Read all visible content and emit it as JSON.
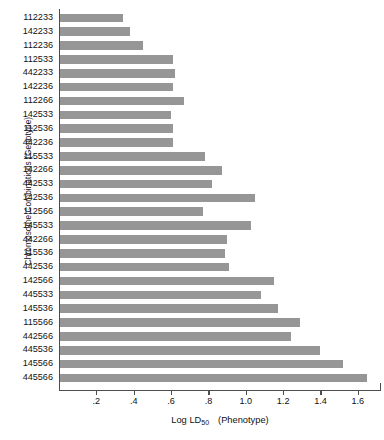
{
  "chart_data": {
    "type": "bar",
    "orientation": "horizontal",
    "title": "",
    "xlabel": "Log LD50  (Phenotype)",
    "ylabel": "Chromosome Combinations (Genotype)",
    "xlim": [
      0,
      1.74
    ],
    "xticks": [
      0.2,
      0.4,
      0.6,
      0.8,
      1.0,
      1.2,
      1.4,
      1.6
    ],
    "xtick_labels": [
      ".2",
      ".4",
      ".6",
      ".8",
      "1.0",
      "1.2",
      "1.4",
      "1.6"
    ],
    "grid": false,
    "legend": false,
    "bar_color": "#969696",
    "axis_color": "#4d4d4d",
    "categories": [
      "112233",
      "142233",
      "112236",
      "112533",
      "442233",
      "142236",
      "112266",
      "142533",
      "112536",
      "442236",
      "115533",
      "142266",
      "442533",
      "142536",
      "112566",
      "145533",
      "442266",
      "115536",
      "442536",
      "142566",
      "445533",
      "145536",
      "115566",
      "442566",
      "445536",
      "145566",
      "445566"
    ],
    "values": [
      0.34,
      0.38,
      0.45,
      0.61,
      0.62,
      0.61,
      0.67,
      0.6,
      0.61,
      0.61,
      0.78,
      0.87,
      0.82,
      1.05,
      0.77,
      1.03,
      0.9,
      0.89,
      0.91,
      1.15,
      1.08,
      1.17,
      1.29,
      1.24,
      1.4,
      1.52,
      1.65
    ]
  },
  "axis": {
    "x_title_main": "Log LD",
    "x_title_sub": "50",
    "x_title_tail": "(Phenotype)",
    "y_title": "Chromosome Combinations (Genotype)"
  }
}
